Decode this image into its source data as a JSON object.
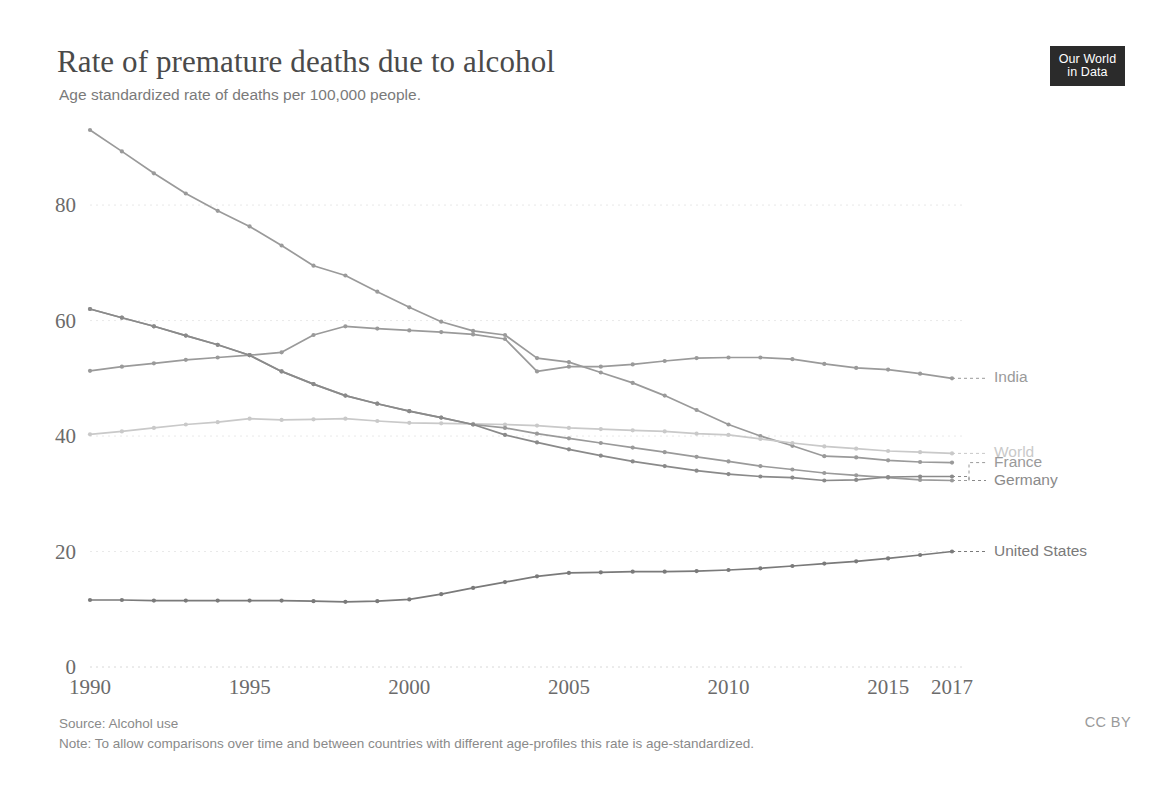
{
  "header": {
    "title": "Rate of premature deaths due to alcohol",
    "subtitle": "Age standardized rate of deaths per 100,000 people."
  },
  "logo": {
    "line1": "Our World",
    "line2": "in Data"
  },
  "footer": {
    "source": "Source: Alcohol use",
    "note": "Note: To allow comparisons over time and between countries with different age-profiles this rate is age-standardized.",
    "license": "CC BY"
  },
  "chart_data": {
    "type": "line",
    "title": "Rate of premature deaths due to alcohol",
    "subtitle": "Age standardized rate of deaths per 100,000 people.",
    "xlabel": "",
    "ylabel": "",
    "xlim": [
      1990,
      2017
    ],
    "ylim": [
      0,
      93
    ],
    "grid": true,
    "legend_position": "right-inline",
    "x": [
      1990,
      1991,
      1992,
      1993,
      1994,
      1995,
      1996,
      1997,
      1998,
      1999,
      2000,
      2001,
      2002,
      2003,
      2004,
      2005,
      2006,
      2007,
      2008,
      2009,
      2010,
      2011,
      2012,
      2013,
      2014,
      2015,
      2016,
      2017
    ],
    "xticks": [
      1990,
      1995,
      2000,
      2005,
      2010,
      2015,
      2017
    ],
    "xtick_labels": [
      "1990",
      "1995",
      "2000",
      "2005",
      "2010",
      "2015",
      "2017"
    ],
    "yticks": [
      0,
      20,
      40,
      60,
      80
    ],
    "ytick_labels": [
      "0",
      "20",
      "40",
      "60",
      "80"
    ],
    "series": [
      {
        "name": "Russia",
        "label": "",
        "color": "#9a9a9a",
        "show_label": false,
        "values": [
          93.0,
          89.3,
          85.5,
          82.0,
          79.0,
          76.3,
          73.0,
          69.5,
          67.8,
          65.0,
          62.3,
          59.8,
          58.2,
          57.5,
          53.5,
          52.8,
          51.0,
          49.2,
          47.0,
          44.5,
          42.0,
          40.0,
          38.3,
          36.5,
          36.3,
          35.8,
          35.5,
          35.4
        ]
      },
      {
        "name": "India",
        "label": "India",
        "color": "#9a9a9a",
        "show_label": true,
        "label_y": 50.0,
        "values": [
          51.3,
          52.0,
          52.6,
          53.2,
          53.6,
          54.0,
          54.5,
          57.5,
          59.0,
          58.6,
          58.3,
          58.0,
          57.6,
          56.8,
          51.2,
          52.0,
          52.0,
          52.4,
          53.0,
          53.5,
          53.6,
          53.6,
          53.3,
          52.5,
          51.8,
          51.5,
          50.8,
          50.0
        ]
      },
      {
        "name": "World",
        "label": "World",
        "color": "#c9c9c9",
        "show_label": true,
        "label_y": 37.0,
        "values": [
          40.3,
          40.8,
          41.4,
          42.0,
          42.4,
          43.0,
          42.8,
          42.9,
          43.0,
          42.6,
          42.3,
          42.2,
          42.1,
          42.0,
          41.8,
          41.4,
          41.2,
          41.0,
          40.8,
          40.4,
          40.2,
          39.5,
          38.8,
          38.2,
          37.8,
          37.4,
          37.2,
          37.0
        ]
      },
      {
        "name": "France",
        "label": "France",
        "color": "#9a9a9a",
        "show_label": true,
        "label_y": 35.4,
        "values": [
          62.0,
          60.5,
          59.0,
          57.4,
          55.8,
          54.0,
          51.2,
          49.0,
          47.0,
          45.6,
          44.3,
          43.2,
          42.0,
          41.4,
          40.4,
          39.6,
          38.8,
          38.0,
          37.2,
          36.4,
          35.6,
          34.8,
          34.2,
          33.6,
          33.2,
          32.8,
          32.4,
          32.3
        ]
      },
      {
        "name": "Germany",
        "label": "Germany",
        "color": "#8a8a8a",
        "show_label": true,
        "label_y": 32.3,
        "values": [
          62.0,
          60.5,
          59.0,
          57.4,
          55.8,
          54.0,
          51.2,
          49.0,
          47.0,
          45.6,
          44.3,
          43.2,
          42.0,
          40.2,
          38.9,
          37.7,
          36.6,
          35.6,
          34.8,
          34.0,
          33.4,
          33.0,
          32.8,
          32.3,
          32.4,
          32.9,
          33.0,
          33.0
        ]
      },
      {
        "name": "United States",
        "label": "United States",
        "color": "#7a7a7a",
        "show_label": true,
        "label_y": 20.0,
        "values": [
          11.6,
          11.6,
          11.5,
          11.5,
          11.5,
          11.5,
          11.5,
          11.4,
          11.3,
          11.4,
          11.7,
          12.6,
          13.7,
          14.7,
          15.7,
          16.3,
          16.4,
          16.5,
          16.5,
          16.6,
          16.8,
          17.1,
          17.5,
          17.9,
          18.3,
          18.8,
          19.4,
          20.0
        ]
      }
    ]
  }
}
